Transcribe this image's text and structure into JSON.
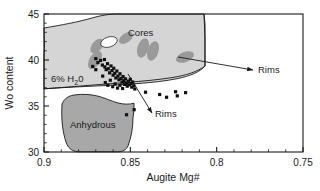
{
  "chart_data": {
    "type": "scatter",
    "title": "",
    "xlabel": "Augite Mg#",
    "ylabel": "Wo content",
    "xlim": [
      0.9,
      0.75
    ],
    "ylim": [
      30,
      45
    ],
    "x_inverted": true,
    "grid": false,
    "legend": "none",
    "xticks": [
      "0.9",
      "0.85",
      "0.8",
      "0.75"
    ],
    "xtick_values": [
      0.9,
      0.85,
      0.8,
      0.75
    ],
    "yticks": [
      "30",
      "35",
      "40",
      "45"
    ],
    "ytick_values": [
      30,
      35,
      40,
      45
    ],
    "x_minor_interval": 0.01,
    "y_minor_interval": 1,
    "annotations": [
      {
        "name": "cores-label",
        "text": "Cores",
        "x": 0.8585,
        "y": 42.4
      },
      {
        "name": "hydrous-field-label",
        "text": "6% H₂0",
        "x": 0.8875,
        "y": 37.7
      },
      {
        "name": "anhydrous-field-label",
        "text": "Anhydrous",
        "x": 0.8775,
        "y": 33.0
      },
      {
        "name": "rims-upper-label",
        "text": "Rims",
        "x": 0.7855,
        "y": 39.1
      },
      {
        "name": "rims-lower-label",
        "text": "Rims",
        "x": 0.8395,
        "y": 34.65
      }
    ],
    "arrows": [
      {
        "name": "rims-upper-arrow",
        "x1": 0.8345,
        "y1": 39.95,
        "x2": 0.7915,
        "y2": 39.1
      },
      {
        "name": "rims-lower-arrow",
        "x1": 0.8485,
        "y1": 38.1,
        "x2": 0.8455,
        "y2": 34.9
      }
    ],
    "fields": [
      {
        "name": "hydrous-6-percent-field",
        "label": "6% H₂0",
        "fill": "#d5d5d5",
        "stroke": "#1a1a1a"
      },
      {
        "name": "anhydrous-field",
        "label": "Anhydrous",
        "fill": "#a8a8a8",
        "stroke": "#1a1a1a"
      }
    ],
    "series": [
      {
        "name": "augite analyses",
        "marker": "square",
        "color": "#111111",
        "points": [
          [
            0.87,
            40.15
          ],
          [
            0.8688,
            39.72
          ],
          [
            0.8672,
            39.95
          ],
          [
            0.8662,
            39.45
          ],
          [
            0.865,
            40.05
          ],
          [
            0.8648,
            39.25
          ],
          [
            0.864,
            38.95
          ],
          [
            0.8632,
            39.6
          ],
          [
            0.8628,
            39.05
          ],
          [
            0.862,
            38.6
          ],
          [
            0.8612,
            39.35
          ],
          [
            0.8606,
            38.85
          ],
          [
            0.86,
            38.35
          ],
          [
            0.8596,
            39.1
          ],
          [
            0.859,
            38.55
          ],
          [
            0.8584,
            38.05
          ],
          [
            0.8578,
            38.8
          ],
          [
            0.8572,
            38.25
          ],
          [
            0.8566,
            37.85
          ],
          [
            0.856,
            38.5
          ],
          [
            0.8554,
            38.0
          ],
          [
            0.8548,
            37.6
          ],
          [
            0.8542,
            38.2
          ],
          [
            0.8538,
            37.75
          ],
          [
            0.8534,
            37.35
          ],
          [
            0.8528,
            37.95
          ],
          [
            0.8522,
            37.5
          ],
          [
            0.8518,
            37.15
          ],
          [
            0.8512,
            37.7
          ],
          [
            0.8506,
            37.3
          ],
          [
            0.85,
            37.9
          ],
          [
            0.8496,
            37.45
          ],
          [
            0.8492,
            37.05
          ],
          [
            0.8486,
            37.6
          ],
          [
            0.848,
            37.2
          ],
          [
            0.8474,
            36.85
          ],
          [
            0.87,
            38.95
          ],
          [
            0.8718,
            39.3
          ],
          [
            0.866,
            38.25
          ],
          [
            0.8645,
            37.55
          ],
          [
            0.863,
            37.25
          ],
          [
            0.8616,
            37.8
          ],
          [
            0.8602,
            37.1
          ],
          [
            0.8588,
            37.4
          ],
          [
            0.8574,
            36.95
          ],
          [
            0.856,
            37.25
          ],
          [
            0.8545,
            36.9
          ],
          [
            0.8412,
            36.5
          ],
          [
            0.833,
            36.25
          ],
          [
            0.829,
            35.95
          ],
          [
            0.8238,
            36.55
          ],
          [
            0.8228,
            36.1
          ],
          [
            0.818,
            36.45
          ],
          [
            0.8478,
            34.6
          ],
          [
            0.8522,
            34.05
          ]
        ]
      }
    ]
  },
  "axes": {
    "x": {
      "label": "Augite Mg#",
      "ticks": [
        "0.9",
        "0.85",
        "0.8",
        "0.75"
      ]
    },
    "y": {
      "label": "Wo content",
      "ticks": [
        "30",
        "35",
        "40",
        "45"
      ]
    }
  },
  "labels": {
    "cores": "Cores",
    "hydrous": "6% H₂0",
    "hydrous_prefix": "6% H",
    "hydrous_sub": "2",
    "hydrous_suffix": "0",
    "anhydrous": "Anhydrous",
    "rims_upper": "Rims",
    "rims_lower": "Rims"
  },
  "colors": {
    "field_light": "#d5d5d5",
    "field_dark": "#a8a8a8",
    "blob_gray": "#9a9a9a",
    "blob_white": "#ffffff",
    "marker": "#111111",
    "axis": "#1a1a1a"
  }
}
